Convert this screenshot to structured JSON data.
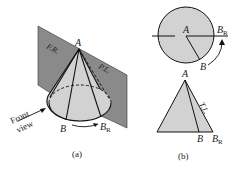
{
  "figure_a": {
    "caption": "(a)",
    "labels": {
      "apex": "A",
      "plane_left": "F.R.",
      "plane_right": "P.L.",
      "base_point": "B",
      "rotated_point": "B",
      "rotated_sub": "R",
      "front_line1": "Front",
      "front_line2": "view"
    }
  },
  "figure_b": {
    "caption": "(b)",
    "top_view": {
      "center": "A",
      "point": "B",
      "rotated_point": "B",
      "rotated_sub": "R"
    },
    "front_view": {
      "apex": "A",
      "true_length": "T.L.",
      "point": "B",
      "rotated_point": "B",
      "rotated_sub": "R"
    }
  },
  "colors": {
    "plane": "#8a8a8a",
    "cone": "#cfcfcf",
    "line": "#1a1a1a"
  }
}
